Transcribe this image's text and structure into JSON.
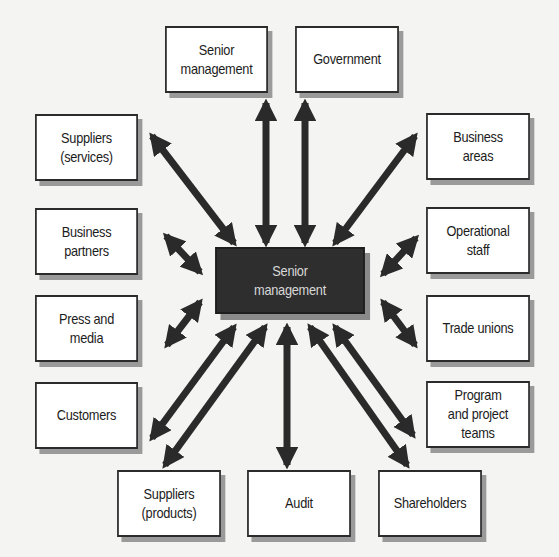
{
  "diagram": {
    "type": "hub-and-spoke stakeholder map",
    "center": {
      "id": "center",
      "label": "Senior\nmanagement"
    },
    "colors": {
      "box_fill": "#ffffff",
      "box_border": "#2b2b2b",
      "center_fill": "#2e2e2e",
      "center_text": "#d8d8d8",
      "arrow": "#2a2a2a",
      "shadow": "#9a9a9a"
    },
    "stakeholders": [
      {
        "id": "senior-management",
        "label": "Senior\nmanagement"
      },
      {
        "id": "government",
        "label": "Government"
      },
      {
        "id": "suppliers-services",
        "label": "Suppliers\n(services)"
      },
      {
        "id": "business-areas",
        "label": "Business\nareas"
      },
      {
        "id": "business-partners",
        "label": "Business\npartners"
      },
      {
        "id": "operational-staff",
        "label": "Operational\nstaff"
      },
      {
        "id": "press-and-media",
        "label": "Press and\nmedia"
      },
      {
        "id": "trade-unions",
        "label": "Trade unions"
      },
      {
        "id": "customers",
        "label": "Customers"
      },
      {
        "id": "program-and-project-teams",
        "label": "Program\nand project\nteams"
      },
      {
        "id": "suppliers-products",
        "label": "Suppliers\n(products)"
      },
      {
        "id": "audit",
        "label": "Audit"
      },
      {
        "id": "shareholders",
        "label": "Shareholders"
      }
    ],
    "connections": [
      {
        "from": "center",
        "to": "senior-management",
        "style": "double-headed"
      },
      {
        "from": "center",
        "to": "government",
        "style": "double-headed"
      },
      {
        "from": "center",
        "to": "suppliers-services",
        "style": "double-headed"
      },
      {
        "from": "center",
        "to": "business-areas",
        "style": "double-headed"
      },
      {
        "from": "center",
        "to": "business-partners",
        "style": "double-headed"
      },
      {
        "from": "center",
        "to": "operational-staff",
        "style": "double-headed"
      },
      {
        "from": "center",
        "to": "press-and-media",
        "style": "double-headed"
      },
      {
        "from": "center",
        "to": "trade-unions",
        "style": "double-headed"
      },
      {
        "from": "center",
        "to": "customers",
        "style": "double-headed"
      },
      {
        "from": "center",
        "to": "program-and-project-teams",
        "style": "double-headed"
      },
      {
        "from": "center",
        "to": "suppliers-products",
        "style": "double-headed"
      },
      {
        "from": "center",
        "to": "audit",
        "style": "double-headed"
      },
      {
        "from": "center",
        "to": "shareholders",
        "style": "double-headed"
      }
    ]
  }
}
